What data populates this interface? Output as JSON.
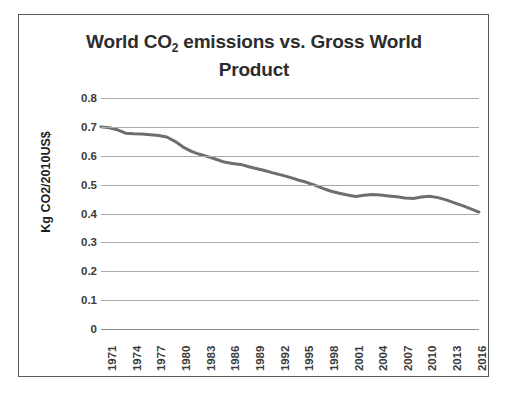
{
  "chart_data": {
    "type": "line",
    "title": "World CO2 emissions vs. Gross World Product",
    "title_main_before": "World CO",
    "title_subscript": "2",
    "title_main_after": " emissions vs. Gross World Product",
    "xlabel": "",
    "ylabel": "Kg CO2/2010US$",
    "ylim": [
      0,
      0.8
    ],
    "y_ticks": [
      "0.8",
      "0.7",
      "0.6",
      "0.5",
      "0.4",
      "0.3",
      "0.2",
      "0.1",
      "0"
    ],
    "y_tick_values": [
      0.8,
      0.7,
      0.6,
      0.5,
      0.4,
      0.3,
      0.2,
      0.1,
      0
    ],
    "x_ticks": [
      "1971",
      "1974",
      "1977",
      "1980",
      "1983",
      "1986",
      "1989",
      "1992",
      "1995",
      "1998",
      "2001",
      "2004",
      "2007",
      "2010",
      "2013",
      "2016"
    ],
    "xlim": [
      1971,
      2017
    ],
    "grid": true,
    "legend": "none",
    "line_color": "#6e6e6e",
    "line_width": 3,
    "series": [
      {
        "name": "Kg CO2 per 2010 US$ of Gross World Product",
        "x": [
          1971,
          1972,
          1973,
          1974,
          1975,
          1976,
          1977,
          1978,
          1979,
          1980,
          1981,
          1982,
          1983,
          1984,
          1985,
          1986,
          1987,
          1988,
          1989,
          1990,
          1991,
          1992,
          1993,
          1994,
          1995,
          1996,
          1997,
          1998,
          1999,
          2000,
          2001,
          2002,
          2003,
          2004,
          2005,
          2006,
          2007,
          2008,
          2009,
          2010,
          2011,
          2012,
          2013,
          2014,
          2015,
          2016,
          2017
        ],
        "values": [
          0.7,
          0.697,
          0.69,
          0.678,
          0.676,
          0.675,
          0.673,
          0.67,
          0.665,
          0.65,
          0.63,
          0.615,
          0.605,
          0.597,
          0.588,
          0.578,
          0.573,
          0.57,
          0.562,
          0.555,
          0.548,
          0.54,
          0.533,
          0.525,
          0.516,
          0.508,
          0.498,
          0.487,
          0.477,
          0.47,
          0.464,
          0.459,
          0.463,
          0.466,
          0.464,
          0.461,
          0.458,
          0.454,
          0.452,
          0.457,
          0.46,
          0.455,
          0.447,
          0.437,
          0.427,
          0.416,
          0.405
        ]
      }
    ]
  }
}
